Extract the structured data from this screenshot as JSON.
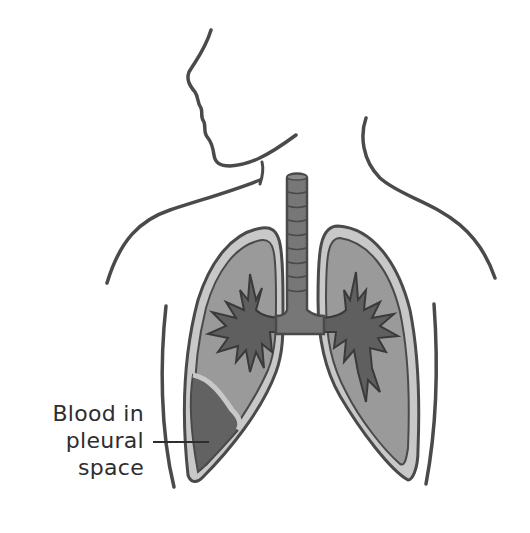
{
  "diagram": {
    "annotation": {
      "lines": [
        "Blood in",
        "pleural",
        "space"
      ],
      "pointer": "leader-line to left lower lung pleural space"
    },
    "colors": {
      "outline": "#4a4a4a",
      "pleura_light": "#c8c8c8",
      "lung_tissue": "#9a9a9a",
      "bronchi": "#5f5f5f",
      "trachea": "#777777",
      "blood": "#626262",
      "background": "#ffffff"
    }
  }
}
